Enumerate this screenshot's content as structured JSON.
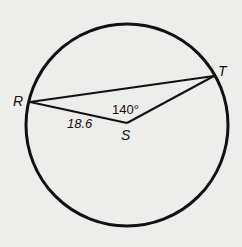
{
  "figure": {
    "points": {
      "R": "R",
      "S": "S",
      "T": "T"
    },
    "angle_label": "140°",
    "segment_label": "18.6",
    "colors": {
      "stroke": "#111111",
      "background": "#ededeb"
    }
  }
}
